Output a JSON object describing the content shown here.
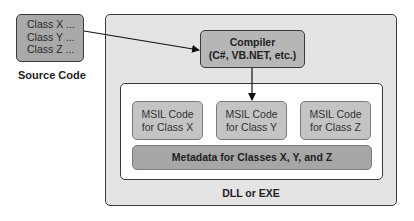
{
  "source": {
    "lines": [
      "Class X ...",
      "Class Y ...",
      "Class Z ..."
    ],
    "label": "Source Code"
  },
  "compiler": {
    "title": "Compiler",
    "subtitle": "(C#, VB.NET, etc.)"
  },
  "msil": [
    {
      "line1": "MSIL Code",
      "line2": "for Class X"
    },
    {
      "line1": "MSIL Code",
      "line2": "for Class Y"
    },
    {
      "line1": "MSIL Code",
      "line2": "for Class Z"
    }
  ],
  "metadata": {
    "label": "Metadata for Classes X, Y, and Z"
  },
  "container": {
    "label": "DLL or EXE"
  },
  "colors": {
    "source_fill": "#a9a9a9",
    "outer_fill": "#e4e4e4",
    "compiler_fill": "#b6b6b6",
    "msil_fill": "#c4c4c4",
    "metadata_fill": "#a6a6a6"
  }
}
